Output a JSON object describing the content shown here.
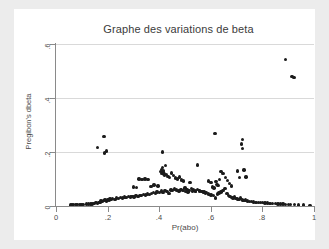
{
  "chart_data": {
    "type": "scatter",
    "title": "Graphe des variations de beta",
    "xlabel": "Pr(abo)",
    "ylabel": "Pregibon's dbeta",
    "xlim": [
      0,
      1
    ],
    "ylim": [
      0,
      0.6
    ],
    "xticks": [
      "0",
      ".2",
      ".4",
      ".6",
      ".8",
      "1"
    ],
    "xtick_values": [
      0,
      0.2,
      0.4,
      0.6,
      0.8,
      1
    ],
    "yticks": [
      "0",
      ".2",
      ".4",
      ".6"
    ],
    "ytick_values": [
      0,
      0.2,
      0.4,
      0.6
    ],
    "grid": "horizontal",
    "legend": null,
    "marker": {
      "shape": "circle",
      "color": "#1b1b1b",
      "size": 3.4
    },
    "points": [
      [
        0.055,
        0.004
      ],
      [
        0.062,
        0.004
      ],
      [
        0.068,
        0.005
      ],
      [
        0.075,
        0.005
      ],
      [
        0.082,
        0.005
      ],
      [
        0.09,
        0.006
      ],
      [
        0.097,
        0.006
      ],
      [
        0.105,
        0.006
      ],
      [
        0.118,
        0.007
      ],
      [
        0.126,
        0.007
      ],
      [
        0.133,
        0.008
      ],
      [
        0.14,
        0.008
      ],
      [
        0.148,
        0.01
      ],
      [
        0.155,
        0.012
      ],
      [
        0.16,
        0.01
      ],
      [
        0.166,
        0.013
      ],
      [
        0.17,
        0.014
      ],
      [
        0.175,
        0.018
      ],
      [
        0.18,
        0.016
      ],
      [
        0.185,
        0.02
      ],
      [
        0.19,
        0.022
      ],
      [
        0.195,
        0.019
      ],
      [
        0.2,
        0.024
      ],
      [
        0.205,
        0.022
      ],
      [
        0.21,
        0.026
      ],
      [
        0.215,
        0.023
      ],
      [
        0.22,
        0.028
      ],
      [
        0.228,
        0.025
      ],
      [
        0.235,
        0.03
      ],
      [
        0.242,
        0.027
      ],
      [
        0.25,
        0.032
      ],
      [
        0.258,
        0.029
      ],
      [
        0.265,
        0.033
      ],
      [
        0.272,
        0.031
      ],
      [
        0.28,
        0.035
      ],
      [
        0.288,
        0.033
      ],
      [
        0.295,
        0.036
      ],
      [
        0.302,
        0.034
      ],
      [
        0.31,
        0.038
      ],
      [
        0.318,
        0.036
      ],
      [
        0.325,
        0.04
      ],
      [
        0.332,
        0.038
      ],
      [
        0.34,
        0.042
      ],
      [
        0.348,
        0.041
      ],
      [
        0.355,
        0.045
      ],
      [
        0.362,
        0.043
      ],
      [
        0.37,
        0.047
      ],
      [
        0.378,
        0.05
      ],
      [
        0.385,
        0.046
      ],
      [
        0.392,
        0.052
      ],
      [
        0.4,
        0.049
      ],
      [
        0.408,
        0.055
      ],
      [
        0.415,
        0.051
      ],
      [
        0.422,
        0.058
      ],
      [
        0.43,
        0.054
      ],
      [
        0.438,
        0.046
      ],
      [
        0.445,
        0.06
      ],
      [
        0.452,
        0.057
      ],
      [
        0.46,
        0.063
      ],
      [
        0.468,
        0.059
      ],
      [
        0.476,
        0.055
      ],
      [
        0.484,
        0.062
      ],
      [
        0.492,
        0.058
      ],
      [
        0.5,
        0.066
      ],
      [
        0.508,
        0.061
      ],
      [
        0.516,
        0.057
      ],
      [
        0.524,
        0.064
      ],
      [
        0.532,
        0.06
      ],
      [
        0.54,
        0.056
      ],
      [
        0.548,
        0.062
      ],
      [
        0.556,
        0.058
      ],
      [
        0.564,
        0.054
      ],
      [
        0.572,
        0.05
      ],
      [
        0.58,
        0.047
      ],
      [
        0.59,
        0.044
      ],
      [
        0.6,
        0.041
      ],
      [
        0.61,
        0.038
      ],
      [
        0.618,
        0.03
      ],
      [
        0.625,
        0.044
      ],
      [
        0.632,
        0.048
      ],
      [
        0.64,
        0.052
      ],
      [
        0.648,
        0.058
      ],
      [
        0.655,
        0.064
      ],
      [
        0.662,
        0.046
      ],
      [
        0.668,
        0.04
      ],
      [
        0.674,
        0.036
      ],
      [
        0.68,
        0.032
      ],
      [
        0.686,
        0.03
      ],
      [
        0.692,
        0.034
      ],
      [
        0.698,
        0.028
      ],
      [
        0.704,
        0.026
      ],
      [
        0.71,
        0.024
      ],
      [
        0.716,
        0.03
      ],
      [
        0.722,
        0.022
      ],
      [
        0.728,
        0.02
      ],
      [
        0.735,
        0.022
      ],
      [
        0.742,
        0.018
      ],
      [
        0.75,
        0.017
      ],
      [
        0.758,
        0.016
      ],
      [
        0.766,
        0.015
      ],
      [
        0.775,
        0.014
      ],
      [
        0.784,
        0.013
      ],
      [
        0.792,
        0.012
      ],
      [
        0.8,
        0.012
      ],
      [
        0.81,
        0.011
      ],
      [
        0.82,
        0.011
      ],
      [
        0.83,
        0.01
      ],
      [
        0.84,
        0.01
      ],
      [
        0.85,
        0.009
      ],
      [
        0.86,
        0.008
      ],
      [
        0.87,
        0.008
      ],
      [
        0.88,
        0.007
      ],
      [
        0.89,
        0.006
      ],
      [
        0.9,
        0.006
      ],
      [
        0.91,
        0.005
      ],
      [
        0.925,
        0.005
      ],
      [
        0.94,
        0.004
      ],
      [
        0.96,
        0.004
      ],
      [
        0.985,
        0.003
      ],
      [
        0.16,
        0.216
      ],
      [
        0.186,
        0.258
      ],
      [
        0.188,
        0.196
      ],
      [
        0.196,
        0.204
      ],
      [
        0.3,
        0.07
      ],
      [
        0.312,
        0.068
      ],
      [
        0.322,
        0.1
      ],
      [
        0.334,
        0.098
      ],
      [
        0.345,
        0.1
      ],
      [
        0.356,
        0.098
      ],
      [
        0.368,
        0.072
      ],
      [
        0.38,
        0.078
      ],
      [
        0.395,
        0.074
      ],
      [
        0.404,
        0.128
      ],
      [
        0.408,
        0.12
      ],
      [
        0.41,
        0.135
      ],
      [
        0.412,
        0.142
      ],
      [
        0.414,
        0.126
      ],
      [
        0.416,
        0.132
      ],
      [
        0.418,
        0.118
      ],
      [
        0.42,
        0.112
      ],
      [
        0.413,
        0.2
      ],
      [
        0.424,
        0.15
      ],
      [
        0.428,
        0.116
      ],
      [
        0.434,
        0.11
      ],
      [
        0.44,
        0.106
      ],
      [
        0.448,
        0.122
      ],
      [
        0.455,
        0.112
      ],
      [
        0.462,
        0.104
      ],
      [
        0.47,
        0.1
      ],
      [
        0.478,
        0.108
      ],
      [
        0.486,
        0.096
      ],
      [
        0.495,
        0.092
      ],
      [
        0.502,
        0.054
      ],
      [
        0.512,
        0.052
      ],
      [
        0.52,
        0.086
      ],
      [
        0.53,
        0.056
      ],
      [
        0.54,
        0.054
      ],
      [
        0.548,
        0.152
      ],
      [
        0.556,
        0.056
      ],
      [
        0.566,
        0.054
      ],
      [
        0.574,
        0.052
      ],
      [
        0.582,
        0.05
      ],
      [
        0.59,
        0.092
      ],
      [
        0.6,
        0.086
      ],
      [
        0.606,
        0.07
      ],
      [
        0.612,
        0.066
      ],
      [
        0.616,
        0.268
      ],
      [
        0.62,
        0.09
      ],
      [
        0.624,
        0.08
      ],
      [
        0.628,
        0.076
      ],
      [
        0.634,
        0.098
      ],
      [
        0.64,
        0.128
      ],
      [
        0.648,
        0.12
      ],
      [
        0.656,
        0.106
      ],
      [
        0.664,
        0.094
      ],
      [
        0.672,
        0.084
      ],
      [
        0.68,
        0.074
      ],
      [
        0.704,
        0.13
      ],
      [
        0.712,
        0.106
      ],
      [
        0.718,
        0.23
      ],
      [
        0.722,
        0.246
      ],
      [
        0.724,
        0.214
      ],
      [
        0.728,
        0.134
      ],
      [
        0.736,
        0.108
      ],
      [
        0.89,
        0.542
      ],
      [
        0.915,
        0.48
      ],
      [
        0.922,
        0.476
      ]
    ]
  }
}
